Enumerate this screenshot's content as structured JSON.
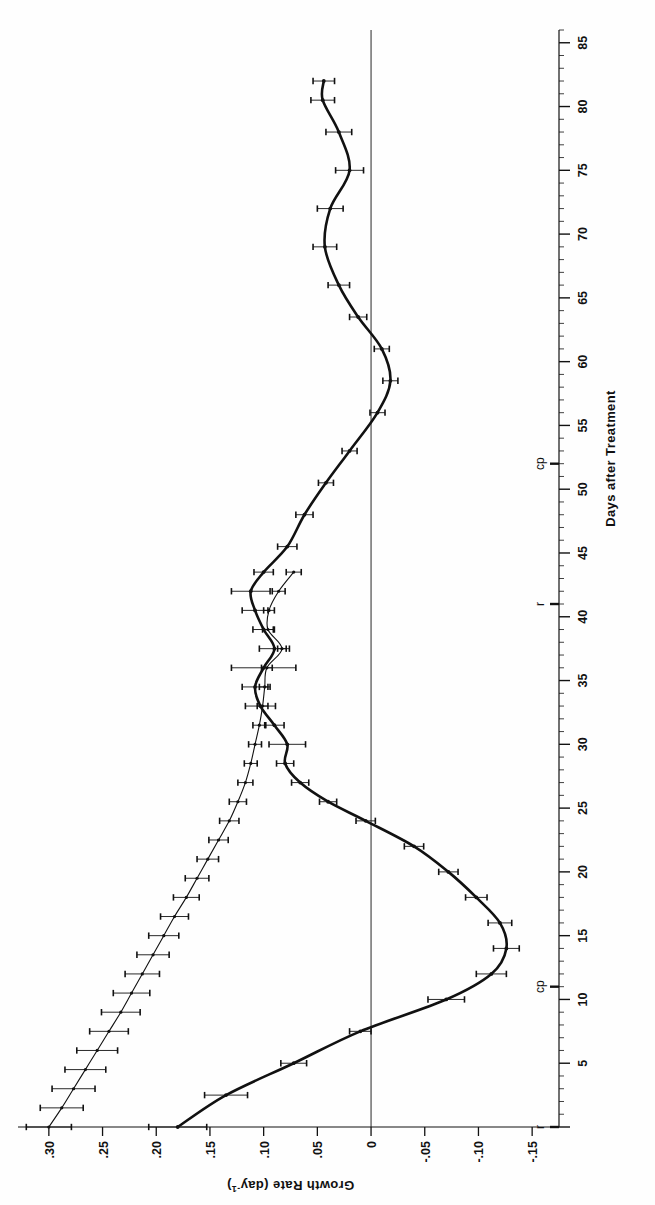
{
  "figure": {
    "background": "#ffffff",
    "ink": "#111111",
    "rotation_note": "figure printed rotated 90 degrees counter-clockwise on page"
  },
  "chart_data": {
    "type": "line",
    "title": "",
    "xlabel": "Days after Treatment",
    "ylabel": "Growth Rate (day⁻¹)",
    "ylabel_main": "Growth Rate",
    "ylabel_unit": "(day",
    "ylabel_unit_sup": "-1",
    "ylabel_unit_close": ")",
    "xlim": [
      0,
      86
    ],
    "ylim": [
      -0.175,
      0.325
    ],
    "grid": false,
    "legend": null,
    "xticks": [
      0,
      5,
      10,
      15,
      20,
      25,
      30,
      35,
      40,
      45,
      50,
      55,
      60,
      65,
      70,
      75,
      80,
      85
    ],
    "xticklabels": [
      "",
      "5",
      "10",
      "15",
      "20",
      "25",
      "30",
      "35",
      "40",
      "45",
      "50",
      "55",
      "60",
      "65",
      "70",
      "75",
      "80",
      "85"
    ],
    "xminor_step": 1,
    "yticks": [
      0.3,
      0.25,
      0.2,
      0.15,
      0.1,
      0.05,
      0.0,
      -0.05,
      -0.1,
      -0.15
    ],
    "yticklabels": [
      ".30",
      ".25",
      ".20",
      ".15",
      ".10",
      ".05",
      "0",
      "-.05",
      "-.10",
      "-.15"
    ],
    "zero_line": 0.0,
    "annotations": [
      {
        "text": "r",
        "x": 0,
        "y_axis": true,
        "name": "annotation-r-day0"
      },
      {
        "text": "cp",
        "x": 11,
        "y_axis": true,
        "name": "annotation-cp-day11"
      },
      {
        "text": "r",
        "x": 41,
        "y_axis": true,
        "name": "annotation-r-day41"
      },
      {
        "text": "cp",
        "x": 52,
        "y_axis": true,
        "name": "annotation-cp-day52"
      }
    ],
    "series": [
      {
        "name": "thin-line-series",
        "style": "thin",
        "linewidth": 1.1,
        "color": "#111111",
        "x": [
          0.0,
          1.5,
          3.0,
          4.5,
          6.0,
          7.5,
          9.0,
          10.5,
          12.0,
          13.5,
          15.0,
          16.5,
          18.0,
          19.5,
          21.0,
          22.5,
          24.0,
          25.5,
          27.0,
          28.5,
          30.0,
          31.5,
          33.0,
          34.5,
          36.0,
          37.5,
          39.0,
          40.5,
          42.0,
          43.5
        ],
        "values": [
          0.3,
          0.288,
          0.277,
          0.266,
          0.255,
          0.244,
          0.233,
          0.223,
          0.213,
          0.203,
          0.193,
          0.183,
          0.172,
          0.162,
          0.152,
          0.142,
          0.132,
          0.124,
          0.117,
          0.112,
          0.108,
          0.104,
          0.101,
          0.099,
          0.097,
          0.083,
          0.096,
          0.095,
          0.086,
          0.072
        ],
        "yerr": [
          0.021,
          0.02,
          0.02,
          0.019,
          0.019,
          0.018,
          0.018,
          0.017,
          0.016,
          0.015,
          0.014,
          0.013,
          0.012,
          0.011,
          0.01,
          0.009,
          0.009,
          0.008,
          0.007,
          0.006,
          0.006,
          0.006,
          0.005,
          0.005,
          0.005,
          0.004,
          0.005,
          0.005,
          0.006,
          0.007
        ]
      },
      {
        "name": "thick-line-series",
        "style": "thick",
        "linewidth": 2.6,
        "color": "#111111",
        "x": [
          0.0,
          2.5,
          5.0,
          7.5,
          10.0,
          12.0,
          14.0,
          16.0,
          18.0,
          20.0,
          22.0,
          24.0,
          25.5,
          27.0,
          28.5,
          30.0,
          31.5,
          33.0,
          34.5,
          36.0,
          37.5,
          39.0,
          40.5,
          42.0,
          43.5,
          45.5,
          48.0,
          50.5,
          53.0,
          56.0,
          58.5,
          61.0,
          63.5,
          66.0,
          69.0,
          72.0,
          75.0,
          78.0,
          80.5,
          82.0
        ],
        "values": [
          0.18,
          0.135,
          0.072,
          0.01,
          -0.07,
          -0.112,
          -0.126,
          -0.12,
          -0.098,
          -0.072,
          -0.04,
          0.005,
          0.04,
          0.066,
          0.08,
          0.078,
          0.09,
          0.103,
          0.108,
          0.1,
          0.09,
          0.1,
          0.108,
          0.112,
          0.1,
          0.078,
          0.062,
          0.042,
          0.02,
          -0.006,
          -0.018,
          -0.01,
          0.012,
          0.03,
          0.043,
          0.038,
          0.02,
          0.03,
          0.045,
          0.044
        ],
        "yerr": [
          0.027,
          0.02,
          0.012,
          0.01,
          0.017,
          0.014,
          0.012,
          0.011,
          0.01,
          0.009,
          0.009,
          0.009,
          0.008,
          0.008,
          0.008,
          0.017,
          0.009,
          0.014,
          0.012,
          0.03,
          0.014,
          0.01,
          0.012,
          0.018,
          0.009,
          0.009,
          0.008,
          0.007,
          0.007,
          0.007,
          0.007,
          0.007,
          0.008,
          0.01,
          0.011,
          0.012,
          0.013,
          0.012,
          0.011,
          0.01
        ]
      }
    ]
  }
}
